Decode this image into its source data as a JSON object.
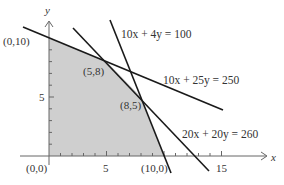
{
  "diagram": {
    "axes": {
      "x_label": "x",
      "y_label": "y",
      "x_ticks_labeled": [
        "5",
        "15"
      ],
      "y_ticks_labeled": [
        "5"
      ],
      "x_range": [
        0,
        15
      ],
      "y_range": [
        0,
        10
      ]
    },
    "constraints": [
      {
        "id": "c1",
        "label": "10x + 4y = 100",
        "a": 10,
        "b": 4,
        "c": 100
      },
      {
        "id": "c2",
        "label": "10x + 25y = 250",
        "a": 10,
        "b": 25,
        "c": 250
      },
      {
        "id": "c3",
        "label": "20x + 20y = 260",
        "a": 20,
        "b": 20,
        "c": 260
      }
    ],
    "vertices": [
      {
        "label": "(0,0)",
        "x": 0,
        "y": 0
      },
      {
        "label": "(0,10)",
        "x": 0,
        "y": 10
      },
      {
        "label": "(5,8)",
        "x": 5,
        "y": 8
      },
      {
        "label": "(8,5)",
        "x": 8,
        "y": 5
      },
      {
        "label": "(10,0)",
        "x": 10,
        "y": 0
      }
    ],
    "colors": {
      "region_fill": "#cfcfcf",
      "line": "#1a1a1a",
      "axis": "#555555"
    }
  }
}
